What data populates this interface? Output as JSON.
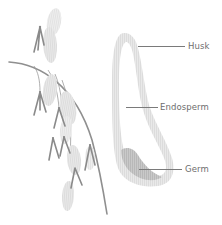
{
  "diagram": {
    "plant": {
      "name": "oat-panicle",
      "stem_color": "#8f8f8f",
      "spikelet_color": "#d2d2d2",
      "spikelet_dark_color": "#9a9a9a"
    },
    "grain": {
      "husk_color": "#e6e6e6",
      "endosperm_color": "#ffffff",
      "germ_color": "#c3c3c3"
    },
    "labels": [
      {
        "id": "husk",
        "text": "Husk"
      },
      {
        "id": "endosperm",
        "text": "Endosperm"
      },
      {
        "id": "germ",
        "text": "Germ"
      }
    ]
  }
}
